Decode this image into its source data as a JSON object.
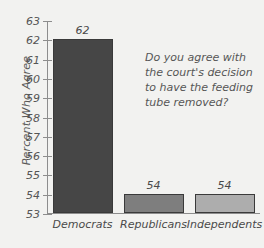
{
  "chart_data": {
    "type": "bar",
    "title": "",
    "xlabel": "",
    "ylabel": "Percent Who Agree",
    "ylim": [
      53,
      63
    ],
    "grid": false,
    "legend": "none",
    "categories": [
      "Democrats",
      "Republicans",
      "Independents"
    ],
    "values": [
      62,
      54,
      54
    ],
    "value_labels": [
      "62",
      "54",
      "54"
    ],
    "tick_labels": [
      "63",
      "62",
      "61",
      "60",
      "59",
      "58",
      "57",
      "56",
      "55",
      "54",
      "53"
    ],
    "bar_colors": [
      "#464646",
      "#7e7e7e",
      "#adadad"
    ],
    "bar_edge_color": "#3a3a3a",
    "axis_color": "#8d8d8d",
    "background_color": "#f2f2f0",
    "text_color": "#4a4a4a",
    "annotation": {
      "lines": [
        "Do you agree with",
        "the court's decision",
        "to have the feeding",
        "tube removed?"
      ]
    }
  }
}
